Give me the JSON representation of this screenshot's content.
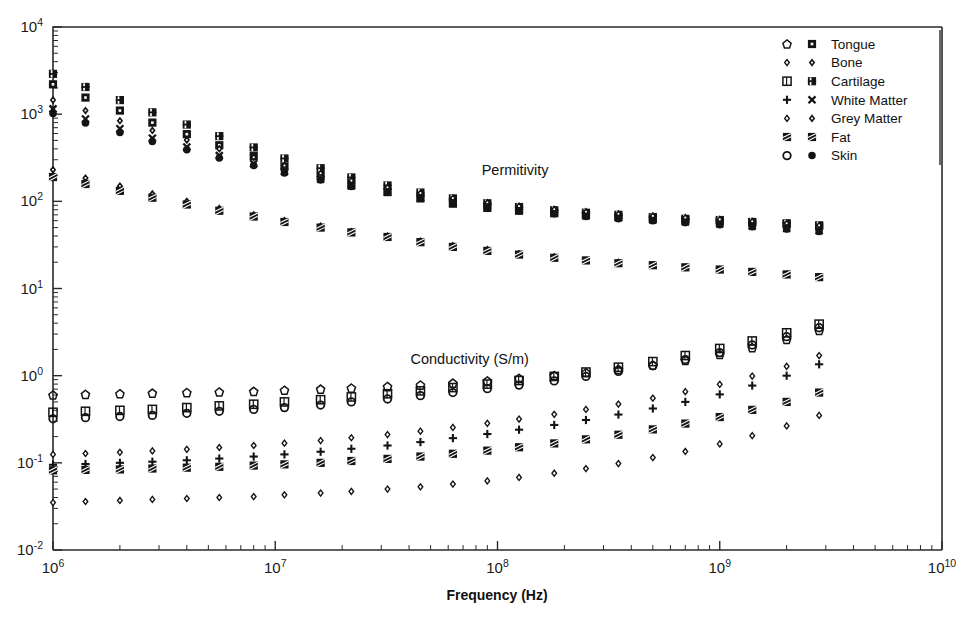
{
  "figure": {
    "width": 967,
    "height": 622,
    "background": "#ffffff",
    "ink_color": "#141414"
  },
  "chart_data": {
    "type": "scatter",
    "title": "",
    "xlabel": "Frequency (Hz)",
    "ylabel": "",
    "xscale": "log",
    "yscale": "log",
    "xlim": [
      1000000,
      10000000000
    ],
    "ylim": [
      0.01,
      10000
    ],
    "x_tick_labels": [
      "10 6",
      "10 7",
      "10 8",
      "10 9",
      "10 10"
    ],
    "y_tick_labels": [
      "10 -2",
      "10 -1",
      "10 0",
      "10 1",
      "10 2",
      "10 3",
      "10 4"
    ],
    "x_ticks": [
      1000000,
      10000000,
      100000000,
      1000000000,
      10000000000
    ],
    "y_ticks": [
      0.01,
      0.1,
      1,
      10,
      100,
      1000,
      10000
    ],
    "grid": false,
    "legend_position": "top-right",
    "annotations": [
      {
        "text": "Permitivity",
        "x": 120000000,
        "y": 200
      },
      {
        "text": "Conductivity (S/m)",
        "x": 75000000,
        "y": 1.35
      }
    ],
    "x": [
      1000000.0,
      1400000.0,
      2000000.0,
      2800000.0,
      4000000.0,
      5600000.0,
      8000000.0,
      11000000.0,
      16000000.0,
      22000000.0,
      32000000.0,
      45000000.0,
      63000000.0,
      90000000.0,
      125000000.0,
      180000000.0,
      250000000.0,
      350000000.0,
      500000000.0,
      700000000.0,
      1000000000.0,
      1400000000.0,
      2000000000.0,
      2800000000.0
    ],
    "series": [
      {
        "name": "Tongue",
        "marker_conductivity": "open-pentagon",
        "marker_permittivity": "filled-square-dot",
        "permittivity": [
          2200,
          1550,
          1100,
          800,
          590,
          440,
          330,
          250,
          195,
          155,
          128,
          108,
          94,
          84,
          78,
          73,
          69,
          66,
          63,
          61,
          59,
          57,
          55,
          52
        ],
        "conductivity": [
          0.6,
          0.61,
          0.62,
          0.63,
          0.64,
          0.65,
          0.66,
          0.68,
          0.7,
          0.72,
          0.75,
          0.78,
          0.82,
          0.87,
          0.93,
          1.0,
          1.08,
          1.18,
          1.32,
          1.5,
          1.75,
          2.1,
          2.6,
          3.3
        ]
      },
      {
        "name": "Bone",
        "marker_conductivity": "small-diamond-open",
        "marker_permittivity": "small-diamond",
        "permittivity": [
          230,
          185,
          150,
          122,
          100,
          83,
          70,
          60,
          52,
          45,
          40,
          35,
          31,
          28,
          25,
          23,
          21,
          20,
          18.5,
          17.5,
          16.5,
          15.5,
          14.5,
          13.5
        ],
        "conductivity": [
          0.035,
          0.036,
          0.037,
          0.038,
          0.039,
          0.04,
          0.041,
          0.043,
          0.045,
          0.047,
          0.05,
          0.053,
          0.057,
          0.062,
          0.068,
          0.076,
          0.086,
          0.098,
          0.115,
          0.135,
          0.165,
          0.205,
          0.265,
          0.35
        ]
      },
      {
        "name": "Cartilage",
        "marker_conductivity": "open-flag",
        "marker_permittivity": "filled-flag",
        "permittivity": [
          2900,
          2050,
          1450,
          1050,
          760,
          560,
          415,
          310,
          240,
          188,
          152,
          126,
          108,
          95,
          86,
          79,
          74,
          70,
          66,
          63,
          61,
          58,
          56,
          53
        ],
        "conductivity": [
          0.38,
          0.39,
          0.4,
          0.41,
          0.43,
          0.45,
          0.47,
          0.5,
          0.53,
          0.57,
          0.62,
          0.67,
          0.73,
          0.8,
          0.88,
          0.98,
          1.1,
          1.25,
          1.45,
          1.7,
          2.05,
          2.5,
          3.1,
          3.9
        ]
      },
      {
        "name": "White Matter",
        "marker_conductivity": "plus",
        "marker_permittivity": "cross",
        "permittivity": [
          1150,
          880,
          680,
          530,
          420,
          335,
          270,
          220,
          180,
          150,
          127,
          110,
          97,
          88,
          80,
          74,
          69,
          65,
          61,
          58,
          55,
          52,
          49,
          46
        ],
        "conductivity": [
          0.095,
          0.097,
          0.1,
          0.103,
          0.107,
          0.112,
          0.118,
          0.125,
          0.134,
          0.145,
          0.158,
          0.173,
          0.192,
          0.214,
          0.24,
          0.272,
          0.31,
          0.358,
          0.42,
          0.5,
          0.61,
          0.77,
          1.0,
          1.35
        ]
      },
      {
        "name": "Grey Matter",
        "marker_conductivity": "small-diamond-open-2",
        "marker_permittivity": "small-diamond-2",
        "permittivity": [
          1450,
          1100,
          840,
          650,
          505,
          400,
          320,
          258,
          210,
          173,
          145,
          124,
          109,
          97,
          88,
          81,
          76,
          72,
          68,
          65,
          62,
          59,
          56,
          53
        ],
        "conductivity": [
          0.125,
          0.128,
          0.132,
          0.137,
          0.143,
          0.15,
          0.158,
          0.168,
          0.18,
          0.194,
          0.211,
          0.231,
          0.255,
          0.284,
          0.318,
          0.36,
          0.41,
          0.472,
          0.552,
          0.655,
          0.795,
          0.99,
          1.28,
          1.7
        ]
      },
      {
        "name": "Fat",
        "marker_conductivity": "hatched-square",
        "marker_permittivity": "hatched-square-2",
        "permittivity": [
          190,
          158,
          132,
          110,
          92,
          78,
          67,
          58,
          50,
          44,
          39,
          34,
          30,
          27,
          24.5,
          22.5,
          21,
          19.5,
          18.5,
          17.5,
          16.5,
          15.5,
          14.5,
          13.5
        ],
        "conductivity": [
          0.082,
          0.083,
          0.084,
          0.086,
          0.088,
          0.09,
          0.093,
          0.096,
          0.1,
          0.105,
          0.111,
          0.118,
          0.127,
          0.138,
          0.151,
          0.167,
          0.186,
          0.21,
          0.242,
          0.282,
          0.335,
          0.405,
          0.5,
          0.64
        ]
      },
      {
        "name": "Skin",
        "marker_conductivity": "open-circle",
        "marker_permittivity": "filled-circle",
        "permittivity": [
          1020,
          790,
          615,
          485,
          390,
          315,
          258,
          212,
          176,
          148,
          126,
          109,
          96,
          86,
          78,
          72,
          67,
          63,
          60,
          57,
          54,
          51,
          48,
          45
        ],
        "conductivity": [
          0.32,
          0.33,
          0.34,
          0.35,
          0.37,
          0.39,
          0.41,
          0.43,
          0.46,
          0.5,
          0.54,
          0.59,
          0.64,
          0.71,
          0.78,
          0.87,
          0.98,
          1.12,
          1.3,
          1.53,
          1.84,
          2.25,
          2.8,
          3.55
        ]
      }
    ]
  },
  "legend": {
    "entries": [
      {
        "label": "Tongue"
      },
      {
        "label": "Bone"
      },
      {
        "label": "Cartilage"
      },
      {
        "label": "White Matter"
      },
      {
        "label": "Grey Matter"
      },
      {
        "label": "Fat"
      },
      {
        "label": "Skin"
      }
    ]
  }
}
